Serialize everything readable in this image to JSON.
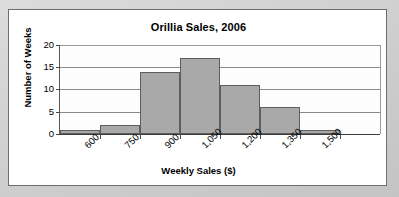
{
  "chart_data": {
    "type": "bar",
    "title": "Orillia Sales, 2006",
    "xlabel": "Weekly Sales ($)",
    "ylabel": "Number of Weeks",
    "categories": [
      "450-600",
      "600-750",
      "750-900",
      "900-1,050",
      "1,050-1,200",
      "1,200-1,350",
      "1,350-1,500",
      "1,500-1,650"
    ],
    "values": [
      1,
      2,
      14,
      17,
      11,
      6,
      1,
      0
    ],
    "bin_edges": [
      "450",
      "600",
      "750",
      "900",
      "1,050",
      "1,200",
      "1,350",
      "1,500",
      "1,650"
    ],
    "xticks": [
      "600",
      "750",
      "900",
      "1,050",
      "1,200",
      "1,350",
      "1,500"
    ],
    "yticks": [
      "0",
      "5",
      "10",
      "15",
      "20"
    ],
    "ylim": [
      0,
      20
    ],
    "grid": true,
    "legend": "none",
    "bar_color": "#a9a9a9",
    "bar_border_color": "#5e5e5e",
    "plot_background": "#fdfdfd",
    "card_background": "#ffffff",
    "card_border_color": "#6e6e6e"
  }
}
